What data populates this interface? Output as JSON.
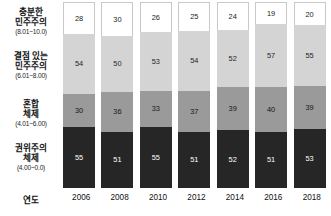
{
  "chart_data": {
    "type": "bar",
    "subtype": "stacked-bar",
    "title": "",
    "xlabel": "연도",
    "ylabel": "",
    "grid": false,
    "legend_position": "left-axis",
    "categories": [
      "2006",
      "2008",
      "2010",
      "2012",
      "2014",
      "2016",
      "2018"
    ],
    "series": [
      {
        "name": "충분한 민주주의",
        "range": "(8.01~10.0)",
        "color": "#ffffff",
        "values": [
          28,
          30,
          26,
          25,
          24,
          19,
          20
        ]
      },
      {
        "name": "결점 있는 민주주의",
        "range": "(6.01~8.00)",
        "color": "#d4d4d4",
        "values": [
          54,
          50,
          53,
          54,
          52,
          57,
          55
        ]
      },
      {
        "name": "혼합 체제",
        "range": "(4.01~6.00)",
        "color": "#9a9a9a",
        "values": [
          30,
          36,
          33,
          37,
          39,
          40,
          39
        ]
      },
      {
        "name": "권위주의 체제",
        "range": "(4.00~0.0)",
        "color": "#262626",
        "values": [
          55,
          51,
          55,
          51,
          52,
          51,
          53
        ]
      }
    ]
  },
  "axis": {
    "category_title": "연도",
    "labels": [
      {
        "name": "충분한 민주주의",
        "line1": "충분한",
        "line2": "민주주의",
        "range": "(8.01~10.0)"
      },
      {
        "name": "결점 있는 민주주의",
        "line1": "결점 있는",
        "line2": "민주주의",
        "range": "(6.01~8.00)"
      },
      {
        "name": "혼합 체제",
        "line1": "혼합",
        "line2": "체제",
        "range": "(4.01~6.00)"
      },
      {
        "name": "권위주의 체제",
        "line1": "권위주의",
        "line2": "체제",
        "range": "(4.00~0.0)"
      }
    ]
  }
}
